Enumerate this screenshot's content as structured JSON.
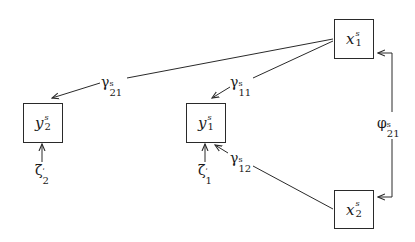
{
  "diagram": {
    "type": "path-diagram",
    "nodes": [
      {
        "id": "x1",
        "symbol": "x",
        "sup": "s",
        "sub": "1",
        "shape": "box"
      },
      {
        "id": "x2",
        "symbol": "x",
        "sup": "s",
        "sub": "2",
        "shape": "box"
      },
      {
        "id": "y1",
        "symbol": "y",
        "sup": "s",
        "sub": "1",
        "shape": "box"
      },
      {
        "id": "y2",
        "symbol": "y",
        "sup": "s",
        "sub": "2",
        "shape": "box"
      },
      {
        "id": "zeta1",
        "symbol": "ζ",
        "sup": "ʹ",
        "sub": "1",
        "shape": "none"
      },
      {
        "id": "zeta2",
        "symbol": "ζ",
        "sup": "ʹ",
        "sub": "2",
        "shape": "none"
      }
    ],
    "edges": [
      {
        "from": "x1",
        "to": "y2",
        "label_symbol": "γ",
        "label_sup": "s",
        "label_sub": "21"
      },
      {
        "from": "x1",
        "to": "y1",
        "label_symbol": "γ",
        "label_sup": "s",
        "label_sub": "11"
      },
      {
        "from": "x2",
        "to": "y1",
        "label_symbol": "γ",
        "label_sup": "s",
        "label_sub": "12"
      },
      {
        "from": "x1",
        "to": "x2",
        "bidirectional": true,
        "label_symbol": "φ",
        "label_sup": "s",
        "label_sub": "21"
      },
      {
        "from": "zeta1",
        "to": "y1"
      },
      {
        "from": "zeta2",
        "to": "y2"
      }
    ]
  },
  "labels": {
    "x1": {
      "sym": "x",
      "sup": "s",
      "sub": "1"
    },
    "x2": {
      "sym": "x",
      "sup": "s",
      "sub": "2"
    },
    "y1": {
      "sym": "y",
      "sup": "s",
      "sub": "1"
    },
    "y2": {
      "sym": "y",
      "sup": "s",
      "sub": "2"
    },
    "zeta1": {
      "sym": "ζ",
      "sup": "ʹ",
      "sub": "1"
    },
    "zeta2": {
      "sym": "ζ",
      "sup": "ʹ",
      "sub": "2"
    },
    "gamma21": {
      "sym": "γ",
      "sup": "s",
      "sub": "21"
    },
    "gamma11": {
      "sym": "γ",
      "sup": "s",
      "sub": "11"
    },
    "gamma12": {
      "sym": "γ",
      "sup": "s",
      "sub": "12"
    },
    "phi21": {
      "sym": "φ",
      "sup": "s",
      "sub": "21"
    }
  },
  "colors": {
    "stroke": "#2a2a2a",
    "background": "#ffffff"
  }
}
